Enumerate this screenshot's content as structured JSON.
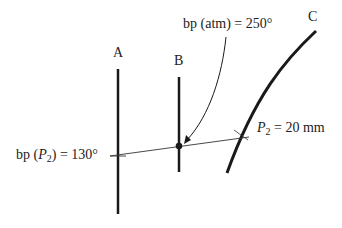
{
  "diagram": {
    "lines": [
      {
        "label": "A"
      },
      {
        "label": "B"
      },
      {
        "label": "C"
      }
    ],
    "annotations": {
      "bp_atm": {
        "prefix": "bp (atm) = ",
        "value": "250",
        "unit": "°"
      },
      "bp_p2": {
        "prefix": "bp (",
        "var": "P",
        "sub": "2",
        "suffix": ") = ",
        "value": "130",
        "unit": "°"
      },
      "p2": {
        "var": "P",
        "sub": "2",
        "eq": " = ",
        "value": "20 mm"
      }
    },
    "colors": {
      "stroke": "#1a1a1a",
      "text": "#222222"
    }
  }
}
